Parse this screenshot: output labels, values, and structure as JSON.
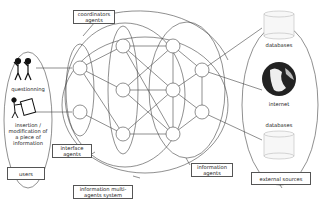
{
  "diagram": {
    "labels": {
      "coordinators": "coordinators\nagents",
      "interface": "interface\nagents",
      "information": "information\nagents",
      "mas": "information multi-\nagents system",
      "users": "users",
      "external": "external sources",
      "questionning": "questionning",
      "insertion": "insertion /\nmodification of\na piece of\ninformation",
      "databases_top": "databases",
      "internet": "internet",
      "databases_bottom": "databases"
    },
    "colors": {
      "line": "#444444",
      "box_border": "#555555"
    }
  }
}
